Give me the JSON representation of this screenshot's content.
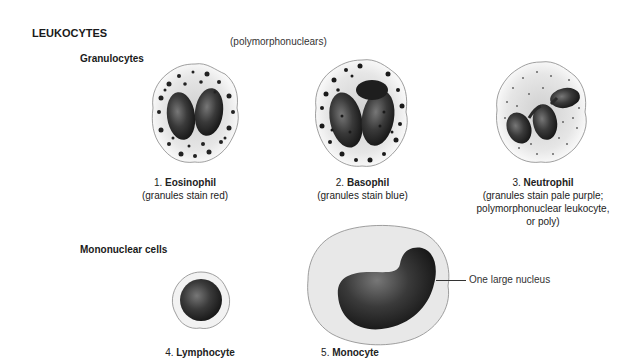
{
  "title": "LEUKOCYTES",
  "groups": {
    "granulocytes": {
      "label": "Granulocytes",
      "sublabel": "(polymorphonuclears)"
    },
    "mononuclear": {
      "label": "Mononuclear cells"
    }
  },
  "cells": [
    {
      "number": "1.",
      "name": "Eosinophil",
      "desc": [
        "(granules stain red)"
      ],
      "icon": "eosinophil-cell"
    },
    {
      "number": "2.",
      "name": "Basophil",
      "desc": [
        "(granules stain blue)"
      ],
      "icon": "basophil-cell"
    },
    {
      "number": "3.",
      "name": "Neutrophil",
      "desc": [
        "(granules stain pale purple;",
        "polymorphonuclear leukocyte,",
        "or poly)"
      ],
      "icon": "neutrophil-cell"
    },
    {
      "number": "4.",
      "name": "Lymphocyte",
      "desc": [],
      "icon": "lymphocyte-cell"
    },
    {
      "number": "5.",
      "name": "Monocyte",
      "desc": [],
      "icon": "monocyte-cell"
    }
  ],
  "annotations": {
    "monocyte_nucleus": "One large nucleus"
  },
  "colors": {
    "nucleus": "#2b2b2b",
    "cytoplasm": "#e4e4e4",
    "outline": "#888888"
  }
}
